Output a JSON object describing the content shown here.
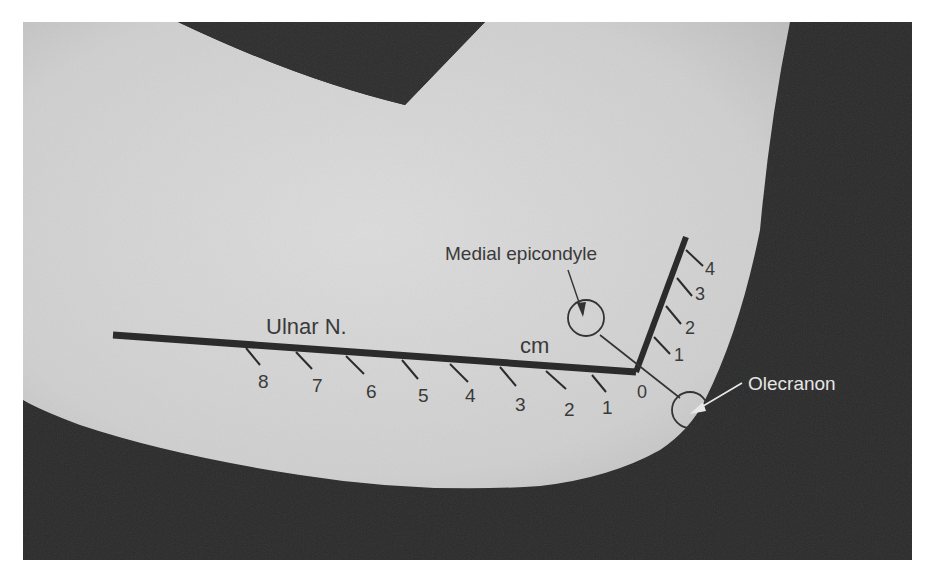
{
  "figure": {
    "labels": {
      "ulnar_nerve": "Ulnar N.",
      "unit": "cm",
      "medial_epicondyle": "Medial epicondyle",
      "olecranon": "Olecranon",
      "origin": "0"
    },
    "ulnar_scale": {
      "ticks": [
        "1",
        "2",
        "3",
        "4",
        "5",
        "6",
        "7",
        "8"
      ]
    },
    "proximal_scale": {
      "ticks": [
        "1",
        "2",
        "3",
        "4"
      ]
    },
    "colors": {
      "skin": "#d2d2d2",
      "background": "#2a2a2a",
      "line": "#2b2b2b",
      "label_dark": "#3a3a3a",
      "label_light": "#e6e6e6"
    }
  }
}
